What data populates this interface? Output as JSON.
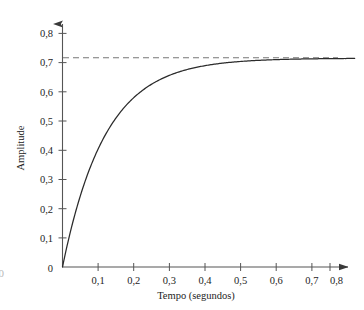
{
  "figure": {
    "edge_glyph": "0",
    "background_color": "#ffffff",
    "curve_color": "#2b2b2b",
    "axis_color": "#555555",
    "asymptote_color": "#777777"
  },
  "chart_data": {
    "type": "line",
    "title": "",
    "xlabel": "Tempo (segundos)",
    "ylabel": "Amplitude",
    "xlim": [
      0,
      0.85
    ],
    "ylim": [
      0,
      0.85
    ],
    "grid": false,
    "legend": "none",
    "x_tick_labels": [
      "0",
      "0,1",
      "0,2",
      "0,3",
      "0,4",
      "0,5",
      "0,6",
      "0,7",
      "0,8"
    ],
    "x_tick_values": [
      0,
      0.1,
      0.2,
      0.3,
      0.4,
      0.5,
      0.6,
      0.7,
      0.8
    ],
    "y_tick_labels": [
      "0",
      "0,1",
      "0,2",
      "0,3",
      "0,4",
      "0,5",
      "0,6",
      "0,7",
      "0,8"
    ],
    "y_tick_values": [
      0,
      0.1,
      0.2,
      0.3,
      0.4,
      0.5,
      0.6,
      0.7,
      0.8
    ],
    "annotations": [
      {
        "name": "steady-state-asymptote",
        "style": "dashed",
        "value": 0.715,
        "from_x": 0.0,
        "to_x": 0.82
      }
    ],
    "series": [
      {
        "name": "resposta-exponencial",
        "style": "solid",
        "amplitude": 0.715,
        "time_constant": 0.12,
        "x": [
          0.0,
          0.01,
          0.02,
          0.03,
          0.04,
          0.05,
          0.06,
          0.07,
          0.08,
          0.09,
          0.1,
          0.12,
          0.14,
          0.16,
          0.18,
          0.2,
          0.22,
          0.24,
          0.26,
          0.28,
          0.3,
          0.33,
          0.36,
          0.39,
          0.42,
          0.45,
          0.5,
          0.55,
          0.6,
          0.65,
          0.7,
          0.75,
          0.8,
          0.82
        ],
        "values": [
          0.0,
          0.057,
          0.11,
          0.16,
          0.205,
          0.247,
          0.286,
          0.322,
          0.355,
          0.386,
          0.414,
          0.464,
          0.506,
          0.541,
          0.571,
          0.597,
          0.618,
          0.637,
          0.652,
          0.665,
          0.676,
          0.69,
          0.7,
          0.707,
          0.712,
          0.715,
          0.715,
          0.715,
          0.715,
          0.715,
          0.715,
          0.715,
          0.715,
          0.715
        ]
      }
    ]
  }
}
